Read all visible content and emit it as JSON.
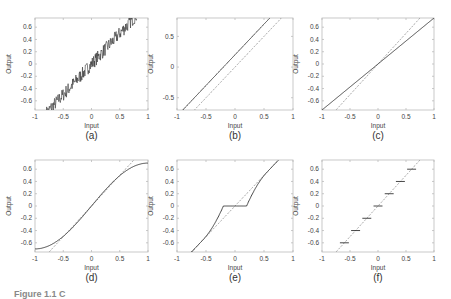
{
  "figure": {
    "caption_visible": "Figure 1.1  C",
    "style": {
      "axis_color": "#bbbbbb",
      "line_color": "#333333",
      "dash_color": "#888888",
      "text_color": "#444444"
    }
  },
  "chart_data": [
    {
      "type": "line",
      "panel": "(a)",
      "title": "",
      "xlabel": "Input",
      "ylabel": "Output",
      "xlim": [
        -1,
        1
      ],
      "ylim": [
        -0.75,
        0.75
      ],
      "xticks": [
        -1,
        -0.5,
        0,
        0.5,
        1
      ],
      "xtick_labels": [
        "-1",
        "-0.5",
        "0",
        "0.5",
        "1"
      ],
      "yticks": [
        -0.6,
        -0.4,
        -0.2,
        0,
        0.2,
        0.4,
        0.6
      ],
      "ytick_labels": [
        "-0.6",
        "-0.4",
        "-0.2",
        "0",
        "0.2",
        "0.4",
        "0.6"
      ],
      "grid": false,
      "description": "Noisy linear response: output = input + random noise (±0.1)",
      "series": [
        {
          "name": "noisy output",
          "style": "solid",
          "function": "noise",
          "x_range": [
            -0.8,
            0.8
          ]
        }
      ]
    },
    {
      "type": "line",
      "panel": "(b)",
      "xlabel": "Input",
      "ylabel": "Output",
      "xlim": [
        -1,
        1
      ],
      "ylim": [
        -0.7,
        0.8
      ],
      "xticks": [
        -1,
        -0.5,
        0,
        0.5,
        1
      ],
      "xtick_labels": [
        "-1",
        "-0.5",
        "0",
        "0.5",
        "1"
      ],
      "yticks": [
        -0.5,
        0,
        0.5
      ],
      "ytick_labels": [
        "-0.5",
        "0",
        "0.5"
      ],
      "grid": false,
      "description": "Offset error: output = input + 0.2",
      "series": [
        {
          "name": "actual",
          "style": "solid",
          "function": "offset",
          "param": 0.2
        },
        {
          "name": "ideal",
          "style": "dashed",
          "function": "identity"
        }
      ]
    },
    {
      "type": "line",
      "panel": "(c)",
      "xlabel": "Input",
      "ylabel": "Output",
      "xlim": [
        -1,
        1
      ],
      "ylim": [
        -0.75,
        0.75
      ],
      "xticks": [
        -1,
        -0.5,
        0,
        0.5,
        1
      ],
      "xtick_labels": [
        "-1",
        "-0.5",
        "0",
        "0.5",
        "1"
      ],
      "yticks": [
        -0.6,
        -0.4,
        -0.2,
        0,
        0.2,
        0.4,
        0.6
      ],
      "ytick_labels": [
        "-0.6",
        "-0.4",
        "-0.2",
        "0",
        "0.2",
        "0.4",
        "0.6"
      ],
      "grid": false,
      "description": "Gain error: output = 0.75 × input",
      "series": [
        {
          "name": "actual",
          "style": "solid",
          "function": "gain",
          "param": 0.75
        },
        {
          "name": "ideal",
          "style": "dashed",
          "function": "identity"
        }
      ]
    },
    {
      "type": "line",
      "panel": "(d)",
      "xlabel": "Input",
      "ylabel": "Output",
      "xlim": [
        -1,
        1
      ],
      "ylim": [
        -0.75,
        0.75
      ],
      "xticks": [
        -1,
        -0.5,
        0,
        0.5,
        1
      ],
      "xtick_labels": [
        "-1",
        "-0.5",
        "0",
        "0.5",
        "1"
      ],
      "yticks": [
        -0.6,
        -0.4,
        -0.2,
        0,
        0.2,
        0.4,
        0.6
      ],
      "ytick_labels": [
        "-0.6",
        "-0.4",
        "-0.2",
        "0",
        "0.2",
        "0.4",
        "0.6"
      ],
      "grid": false,
      "description": "Nonlinearity (saturation): output = 0.7·sin(πx/2)",
      "series": [
        {
          "name": "actual",
          "style": "solid",
          "function": "sine",
          "param": 0.7
        },
        {
          "name": "ideal",
          "style": "dashed",
          "function": "identity"
        }
      ]
    },
    {
      "type": "line",
      "panel": "(e)",
      "xlabel": "Input",
      "ylabel": "Output",
      "xlim": [
        -1,
        1
      ],
      "ylim": [
        -0.75,
        0.75
      ],
      "xticks": [
        -1,
        -0.5,
        0,
        0.5,
        1
      ],
      "xtick_labels": [
        "-1",
        "-0.5",
        "0",
        "0.5",
        "1"
      ],
      "yticks": [
        -0.6,
        -0.4,
        -0.2,
        0,
        0.2,
        0.4,
        0.6
      ],
      "ytick_labels": [
        "-0.6",
        "-0.4",
        "-0.2",
        "0",
        "0.2",
        "0.4",
        "0.6"
      ],
      "grid": false,
      "description": "Dead zone: output = 0 for |input| < 0.2",
      "series": [
        {
          "name": "actual",
          "style": "solid",
          "function": "deadzone",
          "param": 0.2
        },
        {
          "name": "ideal",
          "style": "dashed",
          "function": "identity"
        }
      ]
    },
    {
      "type": "line",
      "panel": "(f)",
      "xlabel": "Input",
      "ylabel": "Output",
      "xlim": [
        -1,
        1
      ],
      "ylim": [
        -0.75,
        0.75
      ],
      "xticks": [
        -1,
        -0.5,
        0,
        0.5,
        1
      ],
      "xtick_labels": [
        "-1",
        "-0.5",
        "0",
        "0.5",
        "1"
      ],
      "yticks": [
        -0.6,
        -0.4,
        -0.2,
        0,
        0.2,
        0.4,
        0.6
      ],
      "ytick_labels": [
        "-0.6",
        "-0.4",
        "-0.2",
        "0",
        "0.2",
        "0.4",
        "0.6"
      ],
      "grid": false,
      "description": "Quantization: output levels at multiples of 0.2",
      "series": [
        {
          "name": "actual",
          "style": "solid",
          "function": "quantize",
          "levels": [
            -0.6,
            -0.4,
            -0.2,
            0,
            0.2,
            0.4,
            0.6
          ],
          "half_width": 0.08
        },
        {
          "name": "ideal",
          "style": "dashed",
          "function": "identity"
        }
      ]
    }
  ]
}
